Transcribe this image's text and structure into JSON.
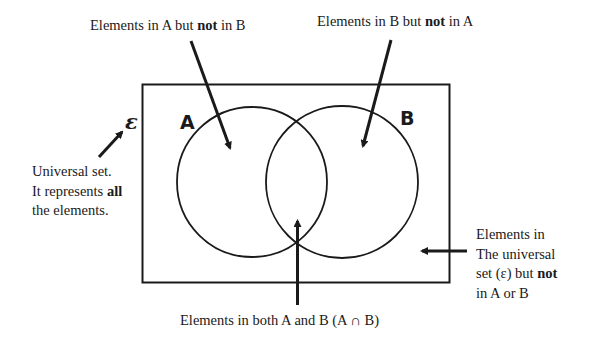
{
  "diagram": {
    "type": "venn",
    "universal_symbol": "ε",
    "sets": [
      {
        "name": "A",
        "label": "A"
      },
      {
        "name": "B",
        "label": "B"
      }
    ],
    "annotations": {
      "a_only": {
        "pre": "Elements in A but ",
        "bold": "not",
        "post": " in B"
      },
      "b_only": {
        "pre": "Elements in B but ",
        "bold": "not",
        "post": " in A"
      },
      "universal": {
        "line1": "Universal set.",
        "line2_pre": "It represents ",
        "line2_bold": "all",
        "line3": "the elements."
      },
      "outside": {
        "line1": "Elements in",
        "line2": "The universal",
        "line3_pre": "set (ε) but ",
        "line3_bold": "not",
        "line4": "in A or B"
      },
      "intersection": "Elements in both A and B (A ∩ B)"
    },
    "colors": {
      "stroke": "#1a1a1a",
      "background": "#ffffff"
    }
  }
}
